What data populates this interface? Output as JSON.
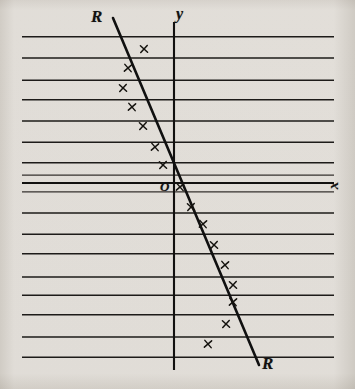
{
  "figure": {
    "title": "",
    "paper_color": "#eceae7",
    "ink_color": "#121110"
  },
  "labels": {
    "regression_line_top": "R",
    "regression_line_bottom": "R",
    "y_axis": "y",
    "x_axis": "x",
    "origin": "O"
  },
  "chart_data": {
    "type": "scatter",
    "title": "",
    "subtitle": "",
    "xlabel": "x",
    "ylabel": "y",
    "legend": [],
    "grid": "horizontal ruled lines only",
    "axes": {
      "x_axis_y_px": 183,
      "y_axis_x_px": 174,
      "origin_label": "O",
      "x_axis_extent_px": [
        22,
        334
      ],
      "y_axis_extent_px": [
        22,
        370
      ],
      "ticks": [],
      "tick_labels": []
    },
    "ruled_lines_y_px": [
      37,
      58,
      80,
      100,
      121,
      142,
      163,
      175,
      183,
      192,
      213,
      234,
      254,
      277,
      295,
      315,
      337,
      357
    ],
    "ruled_line_x_extent_px": [
      22,
      334
    ],
    "points_px": [
      {
        "x": 144,
        "y": 49
      },
      {
        "x": 128,
        "y": 68
      },
      {
        "x": 123,
        "y": 88
      },
      {
        "x": 132,
        "y": 107
      },
      {
        "x": 143,
        "y": 126
      },
      {
        "x": 155,
        "y": 147
      },
      {
        "x": 163,
        "y": 165
      },
      {
        "x": 180,
        "y": 187
      },
      {
        "x": 191,
        "y": 207
      },
      {
        "x": 203,
        "y": 224
      },
      {
        "x": 214,
        "y": 245
      },
      {
        "x": 225,
        "y": 265
      },
      {
        "x": 233,
        "y": 285
      },
      {
        "x": 233,
        "y": 302
      },
      {
        "x": 226,
        "y": 324
      },
      {
        "x": 208,
        "y": 344
      }
    ],
    "points_data": {
      "note": "Coordinates read relative to origin O at pixel (174,183); 1 unit = one ruled line spacing (21 px).",
      "x": [
        -1.43,
        -2.19,
        -2.43,
        -2.0,
        -1.48,
        -0.9,
        -0.52,
        0.29,
        0.81,
        1.38,
        1.9,
        2.43,
        2.81,
        2.81,
        2.48,
        1.62
      ],
      "y": [
        6.38,
        5.48,
        4.52,
        3.62,
        2.71,
        1.71,
        0.86,
        -0.19,
        -1.14,
        -1.95,
        -2.95,
        -3.9,
        -4.86,
        -5.67,
        -6.71,
        -7.67
      ]
    },
    "fit_line": {
      "name": "R R",
      "label_start": "R",
      "label_end": "R",
      "endpoints_px": [
        {
          "x": 113,
          "y": 18
        },
        {
          "x": 259,
          "y": 365
        }
      ],
      "slope_units": -2.38,
      "intercept_units": -0.05
    },
    "marker_style": "x",
    "xlim_px": [
      22,
      334
    ],
    "ylim_px": [
      22,
      370
    ]
  }
}
